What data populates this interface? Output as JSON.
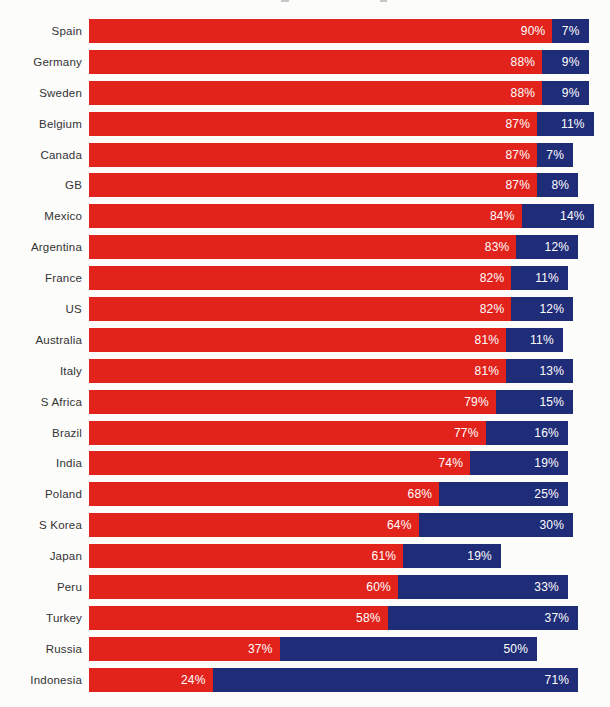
{
  "page": {
    "background_color": "#fcfcfb",
    "label_text_color": "#333333",
    "value_text_color": "#ffffff"
  },
  "chart_data": {
    "type": "bar",
    "orientation": "horizontal",
    "stacked": true,
    "title": "",
    "xlabel": "",
    "ylabel": "",
    "xlim": [
      0,
      100
    ],
    "grid": false,
    "legend": "none",
    "value_suffix": "%",
    "bar_width_represents": "sum of the two segment percentages relative to 100%",
    "categories": [
      "Spain",
      "Germany",
      "Sweden",
      "Belgium",
      "Canada",
      "GB",
      "Mexico",
      "Argentina",
      "France",
      "US",
      "Australia",
      "Italy",
      "S Africa",
      "Brazil",
      "India",
      "Poland",
      "S Korea",
      "Japan",
      "Peru",
      "Turkey",
      "Russia",
      "Indonesia"
    ],
    "series": [
      {
        "name": "red-segment",
        "color": "#e2231c",
        "values": [
          90,
          88,
          88,
          87,
          87,
          87,
          84,
          83,
          82,
          82,
          81,
          81,
          79,
          77,
          74,
          68,
          64,
          61,
          60,
          58,
          37,
          24
        ]
      },
      {
        "name": "blue-segment",
        "color": "#1f2c78",
        "values": [
          7,
          9,
          9,
          11,
          7,
          8,
          14,
          12,
          11,
          12,
          11,
          13,
          15,
          16,
          19,
          25,
          30,
          19,
          33,
          37,
          50,
          71
        ]
      }
    ],
    "data_labels": "each segment shows its percentage in white text, right-aligned inside the segment"
  }
}
